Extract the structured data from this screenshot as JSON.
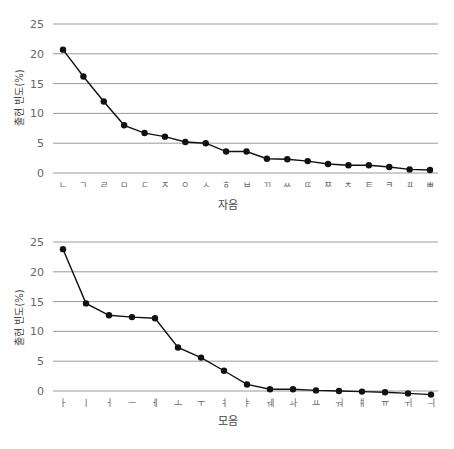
{
  "chart_data": [
    {
      "type": "line",
      "title": "",
      "xlabel": "자음",
      "ylabel": "출현 빈도(%)",
      "ylim": [
        0,
        25
      ],
      "yticks": [
        0,
        5,
        10,
        15,
        20,
        25
      ],
      "grid": true,
      "legend": null,
      "categories": [
        "ㄴ",
        "ㄱ",
        "ㄹ",
        "ㅁ",
        "ㄷ",
        "ㅈ",
        "ㅇ",
        "ㅅ",
        "ㅎ",
        "ㅂ",
        "ㄲ",
        "ㅆ",
        "ㄸ",
        "ㅉ",
        "ㅊ",
        "ㅌ",
        "ㅋ",
        "ㅍ",
        "ㅃ"
      ],
      "values": [
        20.7,
        16.2,
        12.0,
        8.0,
        6.7,
        6.1,
        5.2,
        5.0,
        3.6,
        3.6,
        2.4,
        2.3,
        2.0,
        1.5,
        1.3,
        1.3,
        1.0,
        0.6,
        0.5
      ]
    },
    {
      "type": "line",
      "title": "",
      "xlabel": "모음",
      "ylabel": "출현 빈도(%)",
      "ylim": [
        0,
        25
      ],
      "yticks": [
        0,
        5,
        10,
        15,
        20,
        25
      ],
      "grid": true,
      "legend": null,
      "categories": [
        "ㅏ",
        "ㅣ",
        "ㅓ",
        "ㅡ",
        "ㅔ",
        "ㅗ",
        "ㅜ",
        "ㅕ",
        "ㅑ",
        "ㅞ",
        "ㅘ",
        "ㅛ",
        "ㅝ",
        "ㅒ",
        "ㅠ",
        "ㅟ",
        "ㅢ"
      ],
      "values": [
        23.8,
        14.7,
        12.7,
        12.4,
        12.2,
        7.3,
        5.6,
        3.4,
        1.1,
        0.3,
        0.3,
        0.1,
        0.0,
        -0.1,
        -0.2,
        -0.4,
        -0.6
      ]
    }
  ],
  "colors": {
    "line": "#111111",
    "grid": "#9a9a9a",
    "tick_text": "#666666"
  }
}
